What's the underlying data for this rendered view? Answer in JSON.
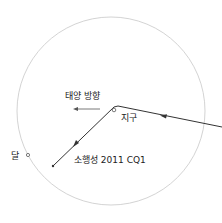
{
  "diagram": {
    "labels": {
      "sun_direction": "태양 방향",
      "earth": "지구",
      "moon": "달",
      "asteroid": "소행성 2011 CQ1"
    },
    "colors": {
      "orbit_circle": "#c8c8c8",
      "trajectory": "#333333",
      "text": "#222222"
    }
  }
}
